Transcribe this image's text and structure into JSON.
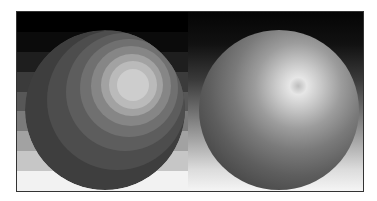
{
  "figure": {
    "left_panel": {
      "label": "posterized-sphere",
      "background_bands": [
        "#000000",
        "#0b0b0b",
        "#1e1e1e",
        "#3b3b3b",
        "#575757",
        "#7a7a7a",
        "#a2a2a2",
        "#c6c6c6",
        "#f2f2f2"
      ],
      "rings": [
        {
          "size": 160,
          "cx": 80,
          "cy": 80,
          "color": "#3e3e3e"
        },
        {
          "size": 140,
          "cx": 92,
          "cy": 70,
          "color": "#4d4d4d"
        },
        {
          "size": 118,
          "cx": 100,
          "cy": 62,
          "color": "#5d5d5d"
        },
        {
          "size": 98,
          "cx": 104,
          "cy": 58,
          "color": "#707070"
        },
        {
          "size": 80,
          "cx": 106,
          "cy": 56,
          "color": "#868686"
        },
        {
          "size": 62,
          "cx": 107,
          "cy": 55,
          "color": "#a2a2a2"
        },
        {
          "size": 48,
          "cx": 108,
          "cy": 55,
          "color": "#bababa"
        },
        {
          "size": 32,
          "cx": 108,
          "cy": 55,
          "color": "#cdcdcd"
        }
      ]
    },
    "right_panel": {
      "label": "smooth-shaded-sphere"
    }
  }
}
